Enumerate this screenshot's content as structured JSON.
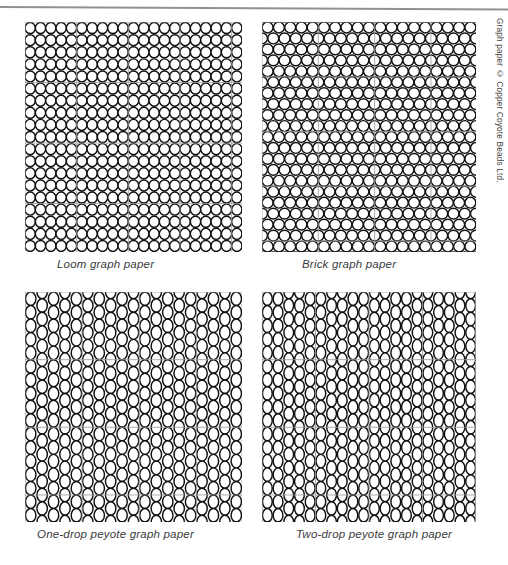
{
  "page": {
    "background_color": "#ffffff",
    "top_rule_color": "#8f9194",
    "bead_outline_color": "#111111",
    "bead_fill_color": "#ffffff",
    "grid_line_color": "#9a9a9a"
  },
  "credit": {
    "text": "Graph paper © Copper Coyote Beads Ltd."
  },
  "panels": [
    {
      "id": "loom",
      "caption": "Loom graph paper",
      "pattern_type": "loom",
      "bead_shape": "wide-ellipse",
      "columns": 21,
      "rows": 19,
      "offset_mode": "aligned-grid",
      "grid_every": 5,
      "x": 25,
      "y": 22,
      "width": 217,
      "height": 230
    },
    {
      "id": "brick",
      "caption": "Brick graph paper",
      "pattern_type": "brick",
      "bead_shape": "circle",
      "columns": 19,
      "rows": 21,
      "offset_mode": "row-offset-half",
      "grid_every": 5,
      "x": 262,
      "y": 22,
      "width": 214,
      "height": 230
    },
    {
      "id": "one-drop-peyote",
      "caption": "One-drop peyote graph paper",
      "pattern_type": "peyote-one-drop",
      "bead_shape": "tall-ellipse",
      "columns": 19,
      "rows": 17,
      "offset_mode": "column-offset-half",
      "grid_every": 5,
      "x": 25,
      "y": 292,
      "width": 217,
      "height": 230
    },
    {
      "id": "two-drop-peyote",
      "caption": "Two-drop peyote graph paper",
      "pattern_type": "peyote-two-drop",
      "bead_shape": "tall-ellipse",
      "columns": 20,
      "rows": 17,
      "offset_mode": "column-pair-offset-half",
      "grid_every": 5,
      "x": 262,
      "y": 292,
      "width": 214,
      "height": 230
    }
  ],
  "captions": {
    "loom": {
      "text": "Loom graph paper",
      "x": 57,
      "y": 258
    },
    "brick": {
      "text": "Brick graph paper",
      "x": 302,
      "y": 258
    },
    "one_drop": {
      "text": "One-drop peyote graph paper",
      "x": 37,
      "y": 528
    },
    "two_drop": {
      "text": "Two-drop peyote graph paper",
      "x": 296,
      "y": 528
    }
  }
}
